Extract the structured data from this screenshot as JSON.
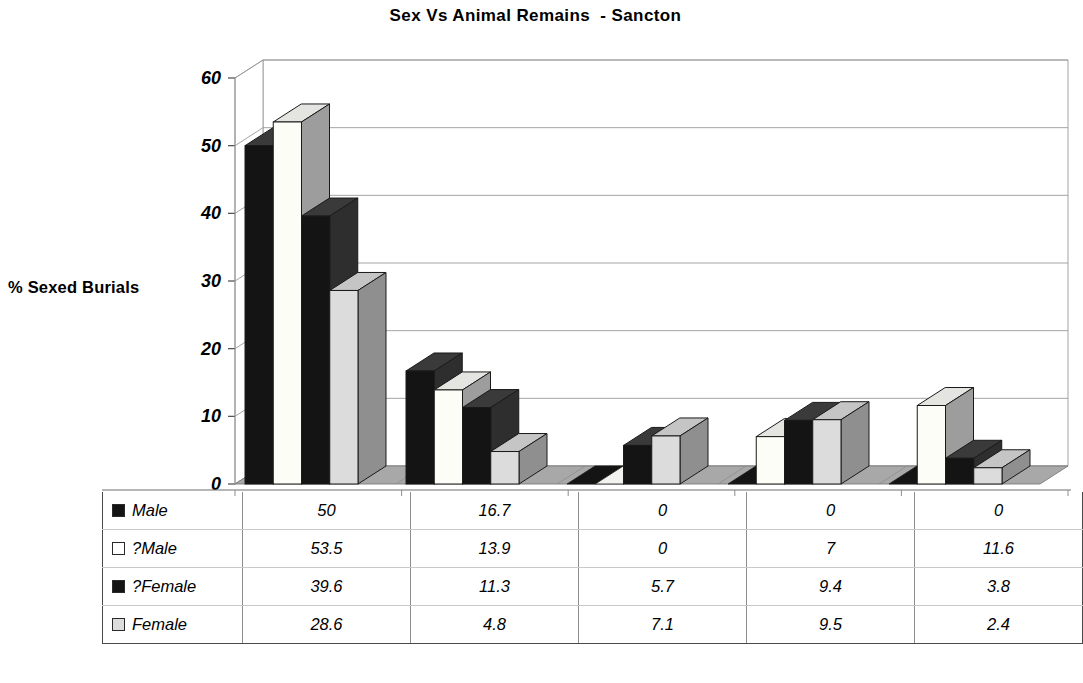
{
  "chart_data": {
    "type": "bar",
    "title": "Sex Vs Animal Remains  - Sancton",
    "xlabel": "",
    "ylabel": "% Sexed Burials",
    "ylim": [
      0,
      60
    ],
    "ytick_step": 10,
    "yticks": [
      "0",
      "10",
      "20",
      "30",
      "40",
      "50",
      "60"
    ],
    "grid": true,
    "legend_position": "data-table",
    "three_d": true,
    "categories": [
      "Animals",
      "Horse",
      "Cattle",
      "Sheep/Goat",
      "Pig"
    ],
    "series": [
      {
        "name": "Male",
        "color": "#141414",
        "values": [
          50,
          16.7,
          0,
          0,
          0
        ],
        "labels": [
          "50",
          "16.7",
          "0",
          "0",
          "0"
        ]
      },
      {
        "name": "?Male",
        "color": "#fdfdf7",
        "values": [
          53.5,
          13.9,
          0,
          7,
          11.6
        ],
        "labels": [
          "53.5",
          "13.9",
          "0",
          "7",
          "11.6"
        ]
      },
      {
        "name": "?Female",
        "color": "#141414",
        "values": [
          39.6,
          11.3,
          5.7,
          9.4,
          3.8
        ],
        "labels": [
          "39.6",
          "11.3",
          "5.7",
          "9.4",
          "3.8"
        ]
      },
      {
        "name": "Female",
        "color": "#dcdcdc",
        "values": [
          28.6,
          4.8,
          7.1,
          9.5,
          2.4
        ],
        "labels": [
          "28.6",
          "4.8",
          "7.1",
          "9.5",
          "2.4"
        ]
      }
    ]
  },
  "table": {
    "corner_label": "",
    "column_headers": [
      "Animals",
      "Horse",
      "Cattle",
      "Sheep/Goat",
      "Pig"
    ],
    "rows": [
      {
        "series": "Male",
        "swatch": "#141414",
        "values": [
          "50",
          "16.7",
          "0",
          "0",
          "0"
        ]
      },
      {
        "series": "?Male",
        "swatch": "#ffffff",
        "values": [
          "53.5",
          "13.9",
          "0",
          "7",
          "11.6"
        ]
      },
      {
        "series": "?Female",
        "swatch": "#141414",
        "values": [
          "39.6",
          "11.3",
          "5.7",
          "9.4",
          "3.8"
        ]
      },
      {
        "series": "Female",
        "swatch": "#dcdcdc",
        "values": [
          "28.6",
          "4.8",
          "7.1",
          "9.5",
          "2.4"
        ]
      }
    ]
  },
  "colors": {
    "floor": "#a8a8a8",
    "gridline": "#9a9a9a",
    "axis": "#6e6e6e",
    "bar_dark": "#141414",
    "bar_white": "#fdfdf7",
    "bar_light": "#dcdcdc",
    "bar_dark_side": "#2e2e2e",
    "bar_white_side": "#9d9d9d",
    "bar_light_side": "#8f8f8f",
    "bar_outline": "#1a1a1a"
  }
}
